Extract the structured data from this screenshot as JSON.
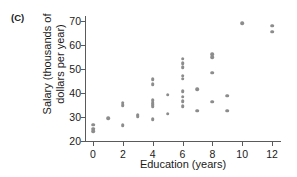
{
  "panel": {
    "label": "(C)"
  },
  "chart_data": {
    "type": "scatter",
    "title": "(C)",
    "xlabel": "Education (years)",
    "ylabel_line1": "Salary (thousands of",
    "ylabel_line2": "dollars per year)",
    "xlim": [
      -0.6,
      13.0
    ],
    "ylim": [
      20,
      72
    ],
    "xticks": [
      0,
      2,
      4,
      6,
      8,
      10,
      12
    ],
    "yticks": [
      20,
      30,
      40,
      50,
      60,
      70
    ],
    "grid": false,
    "legend": null,
    "point_color": "#8c8c8c",
    "axis_color": "#5a5a5a",
    "points": [
      {
        "x": 0,
        "y": 26.8
      },
      {
        "x": 0,
        "y": 25.2
      },
      {
        "x": 0,
        "y": 24.0
      },
      {
        "x": 1,
        "y": 29.6
      },
      {
        "x": 2,
        "y": 36.0
      },
      {
        "x": 2,
        "y": 35.0
      },
      {
        "x": 2,
        "y": 26.6
      },
      {
        "x": 3,
        "y": 31.0
      },
      {
        "x": 3,
        "y": 30.2
      },
      {
        "x": 4,
        "y": 45.6
      },
      {
        "x": 4,
        "y": 43.6
      },
      {
        "x": 4,
        "y": 37.0
      },
      {
        "x": 4,
        "y": 36.0
      },
      {
        "x": 4,
        "y": 35.2
      },
      {
        "x": 4,
        "y": 34.4
      },
      {
        "x": 4,
        "y": 29.0
      },
      {
        "x": 5,
        "y": 39.2
      },
      {
        "x": 5,
        "y": 31.4
      },
      {
        "x": 6,
        "y": 54.2
      },
      {
        "x": 6,
        "y": 52.4
      },
      {
        "x": 6,
        "y": 50.6
      },
      {
        "x": 6,
        "y": 47.2
      },
      {
        "x": 6,
        "y": 46.0
      },
      {
        "x": 6,
        "y": 40.6
      },
      {
        "x": 6,
        "y": 38.4
      },
      {
        "x": 6,
        "y": 36.6
      },
      {
        "x": 6,
        "y": 34.4
      },
      {
        "x": 7,
        "y": 41.6
      },
      {
        "x": 7,
        "y": 32.6
      },
      {
        "x": 8,
        "y": 56.0
      },
      {
        "x": 8,
        "y": 54.8
      },
      {
        "x": 8,
        "y": 48.4
      },
      {
        "x": 8,
        "y": 36.4
      },
      {
        "x": 9,
        "y": 38.8
      },
      {
        "x": 9,
        "y": 32.6
      },
      {
        "x": 10,
        "y": 69.0
      },
      {
        "x": 12,
        "y": 68.0
      },
      {
        "x": 12,
        "y": 65.4
      }
    ]
  }
}
